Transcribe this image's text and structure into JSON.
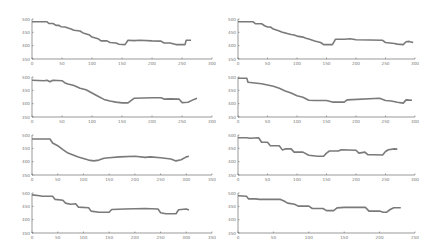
{
  "chart_data": [
    {
      "id": "r1c1",
      "type": "line",
      "title": "",
      "xlabel": "",
      "ylabel": "",
      "xlim": [
        0,
        300
      ],
      "ylim": [
        350,
        500
      ],
      "xticks": [
        0,
        50,
        100,
        150,
        200,
        250,
        300
      ],
      "yticks": [
        500,
        450,
        400,
        350
      ],
      "grid": false,
      "series": [
        {
          "name": "",
          "x": [
            0,
            25,
            28,
            35,
            40,
            45,
            48,
            55,
            65,
            70,
            80,
            85,
            95,
            100,
            110,
            115,
            125,
            130,
            140,
            145,
            155,
            160,
            170,
            180,
            200,
            215,
            220,
            230,
            240,
            255,
            257,
            265
          ],
          "y": [
            490,
            490,
            483,
            483,
            476,
            476,
            471,
            470,
            463,
            458,
            455,
            448,
            441,
            432,
            426,
            418,
            418,
            412,
            410,
            405,
            404,
            420,
            419,
            420,
            418,
            417,
            410,
            410,
            404,
            404,
            420,
            420
          ]
        }
      ]
    },
    {
      "id": "r1c2",
      "type": "line",
      "title": "",
      "xlabel": "",
      "ylabel": "",
      "xlim": [
        0,
        300
      ],
      "ylim": [
        350,
        500
      ],
      "xticks": [
        0,
        50,
        100,
        150,
        200,
        250,
        300
      ],
      "yticks": [
        500,
        450,
        400,
        350
      ],
      "grid": false,
      "series": [
        {
          "name": "",
          "x": [
            0,
            25,
            30,
            40,
            45,
            50,
            55,
            60,
            70,
            75,
            80,
            90,
            95,
            100,
            110,
            115,
            120,
            130,
            140,
            145,
            160,
            165,
            180,
            190,
            200,
            245,
            250,
            265,
            270,
            280,
            285,
            290,
            297
          ],
          "y": [
            490,
            490,
            482,
            482,
            475,
            470,
            470,
            462,
            455,
            450,
            448,
            442,
            440,
            436,
            432,
            428,
            425,
            418,
            412,
            404,
            404,
            424,
            424,
            426,
            422,
            420,
            412,
            408,
            406,
            404,
            415,
            416,
            412
          ]
        }
      ]
    },
    {
      "id": "r2c1",
      "type": "line",
      "title": "",
      "xlabel": "",
      "ylabel": "",
      "xlim": [
        0,
        300
      ],
      "ylim": [
        350,
        500
      ],
      "xticks": [
        0,
        50,
        100,
        150,
        200,
        250,
        300
      ],
      "yticks": [
        500,
        450,
        400,
        350
      ],
      "grid": false,
      "series": [
        {
          "name": "",
          "x": [
            0,
            20,
            25,
            30,
            35,
            50,
            55,
            60,
            70,
            80,
            90,
            100,
            110,
            120,
            130,
            140,
            150,
            160,
            170,
            200,
            215,
            220,
            230,
            245,
            250,
            260,
            270,
            275
          ],
          "y": [
            488,
            486,
            488,
            482,
            488,
            486,
            478,
            474,
            468,
            458,
            452,
            440,
            428,
            416,
            410,
            406,
            403,
            403,
            420,
            422,
            422,
            417,
            418,
            417,
            404,
            405,
            416,
            420
          ]
        }
      ]
    },
    {
      "id": "r2c2",
      "type": "line",
      "title": "",
      "xlabel": "",
      "ylabel": "",
      "xlim": [
        0,
        300
      ],
      "ylim": [
        350,
        500
      ],
      "xticks": [
        0,
        50,
        100,
        150,
        200,
        250,
        300
      ],
      "yticks": [
        500,
        450,
        400,
        350
      ],
      "grid": false,
      "series": [
        {
          "name": "",
          "x": [
            0,
            15,
            17,
            40,
            50,
            60,
            70,
            80,
            90,
            100,
            110,
            120,
            130,
            150,
            160,
            180,
            185,
            240,
            250,
            260,
            270,
            280,
            285,
            295
          ],
          "y": [
            495,
            495,
            480,
            475,
            470,
            465,
            458,
            448,
            440,
            430,
            424,
            413,
            412,
            412,
            406,
            406,
            414,
            420,
            412,
            410,
            405,
            402,
            414,
            413
          ]
        }
      ]
    },
    {
      "id": "r3c1",
      "type": "line",
      "title": "",
      "xlabel": "",
      "ylabel": "",
      "xlim": [
        0,
        350
      ],
      "ylim": [
        350,
        500
      ],
      "xticks": [
        0,
        50,
        100,
        150,
        200,
        250,
        300,
        350
      ],
      "yticks": [
        500,
        450,
        400,
        350
      ],
      "grid": false,
      "series": [
        {
          "name": "",
          "x": [
            0,
            35,
            40,
            50,
            60,
            70,
            80,
            90,
            100,
            110,
            120,
            130,
            140,
            150,
            170,
            200,
            220,
            230,
            250,
            270,
            280,
            290,
            300,
            305
          ],
          "y": [
            485,
            485,
            470,
            460,
            445,
            432,
            425,
            418,
            412,
            406,
            403,
            406,
            413,
            415,
            418,
            420,
            416,
            418,
            415,
            410,
            403,
            407,
            418,
            420
          ]
        }
      ]
    },
    {
      "id": "r3c2",
      "type": "line",
      "title": "",
      "xlabel": "",
      "ylabel": "",
      "xlim": [
        0,
        300
      ],
      "ylim": [
        350,
        500
      ],
      "xticks": [
        0,
        50,
        100,
        150,
        200,
        250,
        300
      ],
      "yticks": [
        500,
        450,
        400,
        350
      ],
      "grid": false,
      "series": [
        {
          "name": "",
          "x": [
            0,
            15,
            20,
            35,
            40,
            50,
            55,
            70,
            75,
            80,
            90,
            95,
            110,
            120,
            135,
            145,
            150,
            155,
            170,
            175,
            200,
            205,
            215,
            220,
            230,
            245,
            250,
            255,
            265,
            270
          ],
          "y": [
            490,
            490,
            488,
            490,
            473,
            473,
            460,
            460,
            444,
            448,
            448,
            436,
            436,
            424,
            420,
            420,
            432,
            440,
            440,
            445,
            443,
            432,
            436,
            426,
            426,
            425,
            438,
            445,
            448,
            447
          ]
        }
      ]
    },
    {
      "id": "r4c1",
      "type": "line",
      "title": "",
      "xlabel": "",
      "ylabel": "",
      "xlim": [
        0,
        350
      ],
      "ylim": [
        350,
        500
      ],
      "xticks": [
        0,
        50,
        100,
        150,
        200,
        250,
        300,
        350
      ],
      "yticks": [
        500,
        450,
        400,
        350
      ],
      "grid": false,
      "series": [
        {
          "name": "",
          "x": [
            0,
            15,
            20,
            40,
            45,
            60,
            65,
            75,
            85,
            90,
            110,
            115,
            130,
            140,
            150,
            155,
            180,
            220,
            245,
            250,
            260,
            280,
            285,
            300,
            305
          ],
          "y": [
            493,
            490,
            488,
            488,
            476,
            473,
            462,
            458,
            460,
            447,
            445,
            432,
            428,
            428,
            428,
            438,
            440,
            442,
            440,
            426,
            422,
            422,
            437,
            440,
            436
          ]
        }
      ]
    },
    {
      "id": "r4c2",
      "type": "line",
      "title": "",
      "xlabel": "",
      "ylabel": "",
      "xlim": [
        0,
        250
      ],
      "ylim": [
        350,
        500
      ],
      "xticks": [
        0,
        50,
        100,
        150,
        200,
        250
      ],
      "yticks": [
        500,
        450,
        400,
        350
      ],
      "grid": false,
      "series": [
        {
          "name": "",
          "x": [
            0,
            12,
            15,
            25,
            30,
            60,
            65,
            70,
            80,
            85,
            100,
            105,
            120,
            125,
            135,
            140,
            150,
            180,
            185,
            200,
            205,
            210,
            215,
            220,
            230
          ],
          "y": [
            490,
            488,
            478,
            478,
            476,
            476,
            470,
            462,
            458,
            451,
            451,
            442,
            442,
            434,
            434,
            444,
            446,
            446,
            432,
            432,
            428,
            428,
            438,
            445,
            445
          ]
        }
      ]
    }
  ]
}
